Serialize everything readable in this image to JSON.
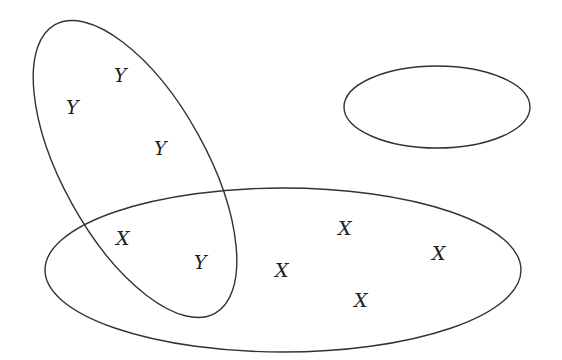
{
  "diagram": {
    "type": "venn",
    "stroke_color": "#333333",
    "sets": [
      {
        "name": "tilted-set",
        "cx": 135,
        "cy": 169,
        "rx": 165,
        "ry": 72,
        "rotate": 61
      },
      {
        "name": "large-set",
        "cx": 283,
        "cy": 270,
        "rx": 238,
        "ry": 82,
        "rotate": 0
      },
      {
        "name": "small-empty-set",
        "cx": 437,
        "cy": 107,
        "rx": 93,
        "ry": 41,
        "rotate": 0
      }
    ],
    "labels": [
      {
        "text": "Y",
        "x": 122,
        "y": 82
      },
      {
        "text": "Y",
        "x": 74,
        "y": 114
      },
      {
        "text": "Y",
        "x": 162,
        "y": 155
      },
      {
        "text": "X",
        "x": 124,
        "y": 245
      },
      {
        "text": "Y",
        "x": 202,
        "y": 269
      },
      {
        "text": "X",
        "x": 283,
        "y": 277
      },
      {
        "text": "X",
        "x": 346,
        "y": 235
      },
      {
        "text": "X",
        "x": 440,
        "y": 260
      },
      {
        "text": "X",
        "x": 362,
        "y": 307
      }
    ]
  }
}
